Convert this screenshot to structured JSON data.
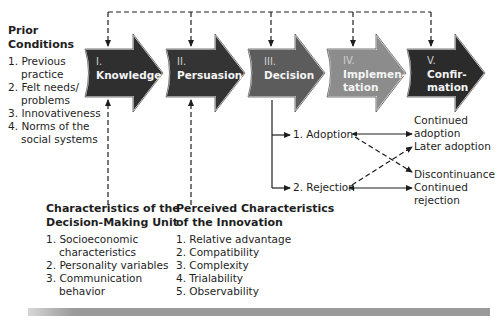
{
  "prior_conditions": {
    "title_line1": "Prior",
    "title_line2": "Conditions",
    "items": [
      {
        "num": "1.",
        "line1": "Previous",
        "line2": "practice"
      },
      {
        "num": "2.",
        "line1": "Felt needs/",
        "line2": "problems"
      },
      {
        "num": "3.",
        "line1": "Innovativeness",
        "line2": ""
      },
      {
        "num": "4.",
        "line1": "Norms of the",
        "line2": "social systems"
      }
    ]
  },
  "stages": [
    {
      "numeral": "I.",
      "name_line1": "Knowledge",
      "name_line2": "",
      "color": "#2f2f2f"
    },
    {
      "numeral": "II.",
      "name_line1": "Persuasion",
      "name_line2": "",
      "color": "#343434"
    },
    {
      "numeral": "III.",
      "name_line1": "Decision",
      "name_line2": "",
      "color": "#5c5c5c"
    },
    {
      "numeral": "IV.",
      "name_line1": "Implemen-",
      "name_line2": "tation",
      "color": "#8c8c8c"
    },
    {
      "numeral": "V.",
      "name_line1": "Confir-",
      "name_line2": "mation",
      "color": "#2b2b2b"
    }
  ],
  "decision_outcomes": {
    "adoption": "1. Adoption",
    "rejection": "2. Rejection"
  },
  "results": {
    "continued_adoption_line1": "Continued",
    "continued_adoption_line2": "adoption",
    "later_adoption": "Later adoption",
    "discontinuance": "Discontinuance",
    "continued_rejection_line1": "Continued",
    "continued_rejection_line2": "rejection"
  },
  "decision_unit": {
    "title_line1": "Characteristics of the",
    "title_line2": "Decision-Making Unit",
    "items": [
      {
        "num": "1.",
        "line1": "Socioeconomic",
        "line2": "characteristics"
      },
      {
        "num": "2.",
        "line1": "Personality variables",
        "line2": ""
      },
      {
        "num": "3.",
        "line1": "Communication",
        "line2": "behavior"
      }
    ]
  },
  "innovation": {
    "title_line1": "Perceived Characteristics",
    "title_line2": "of the Innovation",
    "items": [
      "1. Relative advantage",
      "2. Compatibility",
      "3. Complexity",
      "4. Trialability",
      "5. Observability"
    ]
  },
  "colors": {
    "line": "#1e1e1e",
    "stage_text": "#f4f4f4",
    "numeral_text": "#cfcfcf"
  }
}
